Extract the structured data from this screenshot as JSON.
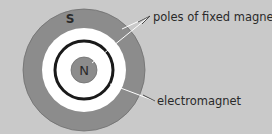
{
  "diagram": {
    "outer_pole_label": "S",
    "inner_pole_label": "N",
    "annotations": {
      "poles": "poles of fixed magnet",
      "electromagnet": "electromagnet"
    }
  },
  "colors": {
    "background": "#c9c9c9",
    "outer_ring": "#8c8c8c",
    "gap": "#ffffff",
    "coil": "#1a1a1a",
    "inner_pole": "#8c8c8c",
    "leader_line": "#ffffff"
  }
}
